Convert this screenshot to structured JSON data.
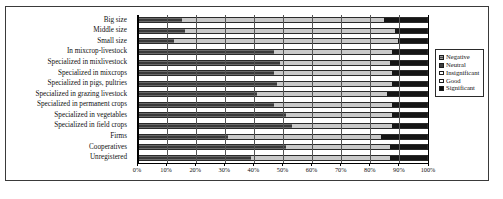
{
  "chart_data": {
    "type": "bar",
    "orientation": "horizontal",
    "stacked": true,
    "stacked_mode": "percent",
    "title": "",
    "xlabel": "",
    "ylabel": "",
    "xlim": [
      0,
      100
    ],
    "grid": true,
    "legend_position": "right",
    "xticks": [
      "0%",
      "10%",
      "20%",
      "30%",
      "40%",
      "50%",
      "60%",
      "70%",
      "80%",
      "90%",
      "100%"
    ],
    "xtick_values": [
      0,
      10,
      20,
      30,
      40,
      50,
      60,
      70,
      80,
      90,
      100
    ],
    "categories": [
      "Big size",
      "Middle size",
      "Small size",
      "In mixcrop-livestock",
      "Specialized in mixlivestock",
      "Specialized in mixcrops",
      "Specialized in pigs, pultries",
      "Specialized in grazing livestock",
      "Specialized in permanent crops",
      "Specialized in vegetables",
      "Specialized in field crops",
      "Firms",
      "Cooperatives",
      "Unregistered"
    ],
    "series": [
      {
        "name": "Negative",
        "key": "negative",
        "color": "#3a3a3a",
        "values": [
          15,
          16,
          12,
          47,
          49,
          47,
          48,
          41,
          47,
          51,
          53,
          31,
          51,
          39
        ]
      },
      {
        "name": "Neutral",
        "key": "neutral",
        "color": "#4a4a4a",
        "values": [
          0,
          0,
          0,
          0,
          0,
          0,
          0,
          0,
          0,
          0,
          0,
          0,
          0,
          0
        ]
      },
      {
        "name": "Insignificant",
        "key": "insig",
        "color": "#c9c9c9",
        "values": [
          70,
          73,
          78,
          41,
          38,
          41,
          40,
          45,
          41,
          37,
          35,
          53,
          36,
          48
        ]
      },
      {
        "name": "Good",
        "key": "good",
        "color": "#eaeaea",
        "values": [
          0,
          0,
          0,
          0,
          0,
          0,
          0,
          0,
          0,
          0,
          0,
          0,
          0,
          0
        ]
      },
      {
        "name": "Significant",
        "key": "signif",
        "color": "#151515",
        "values": [
          15,
          11,
          10,
          12,
          13,
          12,
          12,
          14,
          12,
          12,
          12,
          16,
          13,
          13
        ]
      }
    ]
  },
  "legend": {
    "items": [
      {
        "label": "Negative",
        "key": "negative"
      },
      {
        "label": "Neutral",
        "key": "neutral"
      },
      {
        "label": "Insignificant",
        "key": "insig"
      },
      {
        "label": "Good",
        "key": "good"
      },
      {
        "label": "Significant",
        "key": "signif"
      }
    ]
  }
}
